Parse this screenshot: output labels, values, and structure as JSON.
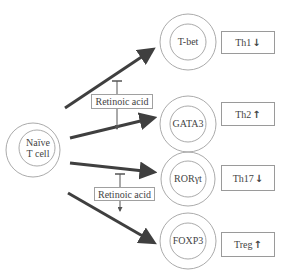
{
  "diagram": {
    "source": {
      "label_line1": "Naïve",
      "label_line2": "T cell"
    },
    "transcription_factors": [
      {
        "label": "T-bet"
      },
      {
        "label": "GATA3"
      },
      {
        "label": "RORγt"
      },
      {
        "label": "FOXP3"
      }
    ],
    "outcomes": [
      {
        "label": "Th1",
        "direction": "↓"
      },
      {
        "label": "Th2",
        "direction": "↑"
      },
      {
        "label": "Th17",
        "direction": "↓"
      },
      {
        "label": "Treg",
        "direction": "↑"
      }
    ],
    "modulators": [
      {
        "label": "Retinoic acid",
        "effect_up": "inhibits",
        "effect_down": "promotes"
      },
      {
        "label": "Retinoic acid",
        "effect_up": "inhibits",
        "effect_down": "promotes"
      }
    ],
    "colors": {
      "arrow": "#3f3f3f",
      "circle": "#9a9a9a",
      "text": "#444444"
    }
  }
}
